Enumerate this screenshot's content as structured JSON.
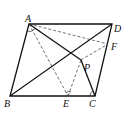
{
  "diagram": {
    "type": "geometry",
    "shape": "rhombus ABCD",
    "points": {
      "A": {
        "label": "A",
        "x": 29,
        "y": 24
      },
      "B": {
        "label": "B",
        "x": 10,
        "y": 96
      },
      "C": {
        "label": "C",
        "x": 95,
        "y": 96
      },
      "D": {
        "label": "D",
        "x": 112,
        "y": 24
      },
      "E": {
        "label": "E",
        "x": 68,
        "y": 96
      },
      "F": {
        "label": "F",
        "x": 108,
        "y": 44
      },
      "P": {
        "label": "P",
        "x": 81,
        "y": 60
      }
    },
    "solid_segments": [
      "AB",
      "BC",
      "CD",
      "DA",
      "AP",
      "PC",
      "BP",
      "PD"
    ],
    "dashed_segments": [
      "AE",
      "AF",
      "EP",
      "PF"
    ],
    "angle_marks": [
      "A",
      "E",
      "C"
    ]
  }
}
